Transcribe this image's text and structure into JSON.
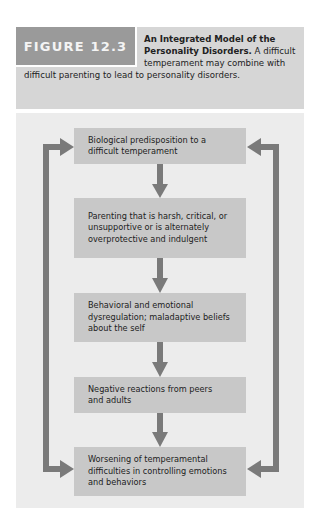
{
  "figure": {
    "label": "FIGURE 12.3",
    "title": "An Integrated Model of the Personality Disorders.",
    "caption": "A difficult temperament may combine with difficult parenting to lead to personality disorders."
  },
  "diagram": {
    "boxes": [
      {
        "text": "Biological predisposition to a difficult temperament"
      },
      {
        "text": "Parenting that is harsh, critical, or unsupportive or is alternately overprotective and indulgent"
      },
      {
        "text": "Behavioral and emotional dysregulation; maladaptive beliefs about the self"
      },
      {
        "text": "Negative reactions from peers and adults"
      },
      {
        "text": "Worsening of temperamental difficulties in controlling emotions and behaviors"
      }
    ],
    "flow": "top-to-bottom with feedback loops on both sides from bottom box back to top box",
    "colors": {
      "box": "#c8c8c8",
      "arrow": "#7a7a7a",
      "panel": "#ececec",
      "header_panel": "#d6d6d6",
      "label_box": "#9a9a9a"
    }
  }
}
